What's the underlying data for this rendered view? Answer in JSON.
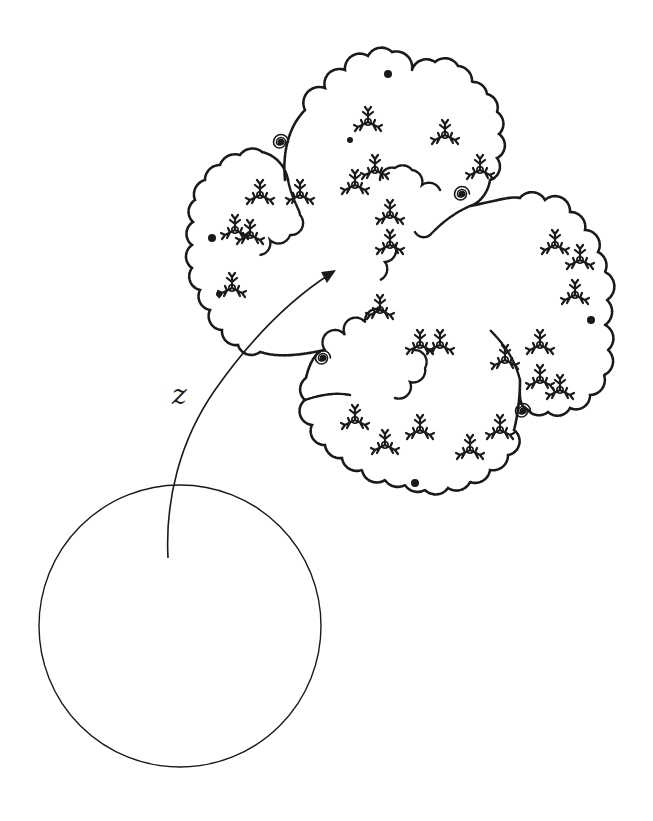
{
  "figure": {
    "type": "mapping-diagram",
    "ink_color": "#1a1a1a",
    "background": "#ffffff"
  },
  "disk": {
    "shape": "unit-disk-circle",
    "center": [
      180,
      626
    ],
    "radius": 141
  },
  "arrow": {
    "label": "z",
    "label_position": [
      172,
      386
    ],
    "start": [
      168,
      558
    ],
    "end": [
      335,
      271
    ]
  },
  "fractal": {
    "shape": "filled-julia-set",
    "lobes": 4,
    "spirals": [
      [
        462,
        194
      ],
      [
        323,
        358
      ],
      [
        523,
        411
      ],
      [
        213,
        240
      ]
    ],
    "bbox": [
      187,
      45,
      617,
      503
    ]
  }
}
